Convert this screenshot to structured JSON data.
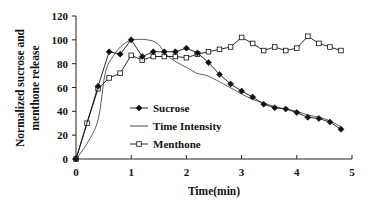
{
  "chart_data": {
    "type": "line",
    "title": "",
    "xlabel": "Time(min)",
    "ylabel": "Normalized sucrose and menthone release",
    "ylabel_lines": [
      "Normalized sucrose and",
      "menthone release"
    ],
    "xlim": [
      0,
      5
    ],
    "ylim": [
      0,
      120
    ],
    "xticks": [
      0,
      1,
      2,
      3,
      4,
      5
    ],
    "yticks": [
      0,
      20,
      40,
      60,
      80,
      100,
      120
    ],
    "grid": false,
    "legend_position": "inside-lower-center",
    "series": [
      {
        "name": "Sucrose",
        "marker": "filled-diamond",
        "color": "#111111",
        "x": [
          0,
          0.4,
          0.6,
          0.8,
          1.0,
          1.2,
          1.4,
          1.6,
          1.8,
          2.0,
          2.2,
          2.4,
          2.6,
          2.8,
          3.0,
          3.2,
          3.4,
          3.6,
          3.8,
          4.0,
          4.2,
          4.4,
          4.6,
          4.8
        ],
        "values": [
          0,
          61,
          90,
          88,
          100,
          86,
          90,
          90,
          90,
          93,
          89,
          81,
          71,
          63,
          57,
          52,
          46,
          43,
          42,
          39,
          35,
          34,
          31,
          25
        ]
      },
      {
        "name": "Time Intensity",
        "marker": "none",
        "color": "#333333",
        "x": [
          0,
          0.2,
          0.4,
          0.53,
          0.67,
          0.85,
          1.04,
          1.29,
          1.47,
          1.65,
          1.83,
          2.0,
          2.19,
          2.37,
          2.55,
          2.79,
          3.15,
          3.4,
          3.6,
          3.8,
          4.0,
          4.2,
          4.4,
          4.6,
          4.8
        ],
        "values": [
          0,
          13,
          33,
          72,
          86,
          96,
          100,
          100,
          97,
          87,
          81,
          77,
          72,
          70,
          66,
          60,
          51,
          47,
          44,
          42,
          40,
          37,
          35,
          32,
          27
        ]
      },
      {
        "name": "Menthone",
        "marker": "open-square",
        "color": "#111111",
        "x": [
          0,
          0.2,
          0.4,
          0.6,
          0.8,
          1.0,
          1.2,
          1.4,
          1.6,
          1.8,
          2.0,
          2.2,
          2.4,
          2.6,
          2.8,
          3.0,
          3.2,
          3.4,
          3.6,
          3.8,
          4.0,
          4.2,
          4.4,
          4.6,
          4.8
        ],
        "values": [
          0,
          30,
          59,
          68,
          72,
          87,
          83,
          86,
          86,
          86,
          85,
          88,
          90,
          92,
          94,
          102,
          97,
          91,
          94,
          91,
          93,
          103,
          97,
          94,
          91
        ]
      }
    ]
  }
}
